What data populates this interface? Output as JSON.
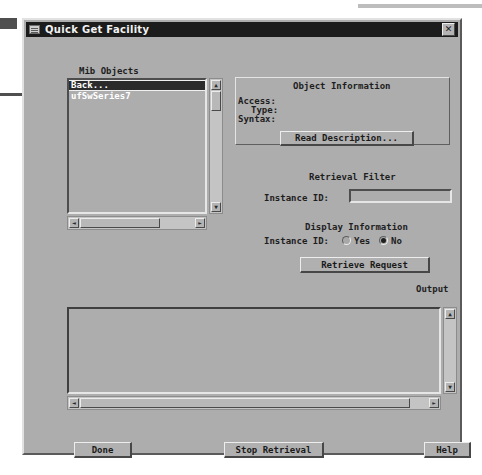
{
  "window": {
    "title": "Quick Get Facility",
    "icon": "window-menu-icon",
    "close_label": "✕"
  },
  "mib_objects": {
    "label": "Mib Objects",
    "items": [
      {
        "text": "Back...",
        "selected": true
      },
      {
        "text": "ufSwSeries7",
        "selected": false
      }
    ],
    "scroll_up": "▲",
    "scroll_down": "▼",
    "scroll_left": "◄",
    "scroll_right": "►"
  },
  "object_information": {
    "title": "Object Information",
    "access_label": "Access:",
    "access_value": "",
    "type_label": "Type:",
    "type_value": "",
    "syntax_label": "Syntax:",
    "syntax_value": "",
    "read_description_label": "Read Description..."
  },
  "retrieval_filter": {
    "title": "Retrieval Filter",
    "instance_id_label": "Instance ID:",
    "instance_id_value": "",
    "instance_id_placeholder": ""
  },
  "display_information": {
    "title": "Display Information",
    "instance_id_label": "Instance ID:",
    "yes_label": "Yes",
    "no_label": "No",
    "selected": "No"
  },
  "actions": {
    "retrieve_request_label": "Retrieve Request",
    "done_label": "Done",
    "stop_retrieval_label": "Stop Retrieval",
    "help_label": "Help"
  },
  "output": {
    "label": "Output",
    "value": "",
    "scroll_up": "▲",
    "scroll_down": "▼",
    "scroll_left": "◄",
    "scroll_right": "►"
  },
  "colors": {
    "window_face": "#adadad",
    "titlebar": "#1c1c1c",
    "title_text": "#f2f2f2",
    "selection": "#2b2b2b",
    "scrollbar_trough": "#c4c4c4"
  }
}
